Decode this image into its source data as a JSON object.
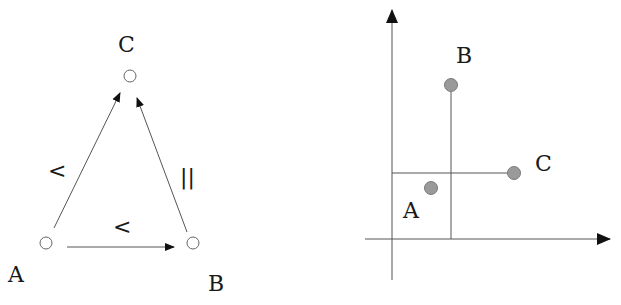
{
  "left_diagram": {
    "type": "directed-graph",
    "nodes": [
      {
        "id": "A",
        "label": "A",
        "x": 46,
        "y": 243,
        "label_x": 8,
        "label_y": 282
      },
      {
        "id": "B",
        "label": "B",
        "x": 193,
        "y": 243,
        "label_x": 208,
        "label_y": 290
      },
      {
        "id": "C",
        "label": "C",
        "x": 130,
        "y": 76,
        "label_x": 118,
        "label_y": 52
      }
    ],
    "edges": [
      {
        "from": "A",
        "to": "C",
        "relation": "<"
      },
      {
        "from": "A",
        "to": "B",
        "relation": "<"
      },
      {
        "from": "B",
        "to": "C",
        "relation": "||"
      }
    ],
    "edge_labels": {
      "ac": "<",
      "ab": "<",
      "bc": "||"
    }
  },
  "right_diagram": {
    "type": "coordinate-plot",
    "points": [
      {
        "id": "A",
        "label": "A",
        "x": 431,
        "y": 188
      },
      {
        "id": "B",
        "label": "B",
        "x": 451,
        "y": 85
      },
      {
        "id": "C",
        "label": "C",
        "x": 514,
        "y": 173
      }
    ],
    "labels": {
      "A": "A",
      "B": "B",
      "C": "C"
    }
  },
  "colors": {
    "line": "#555555",
    "point_fill": "#9a9a9a",
    "text": "#1a1a1a"
  }
}
